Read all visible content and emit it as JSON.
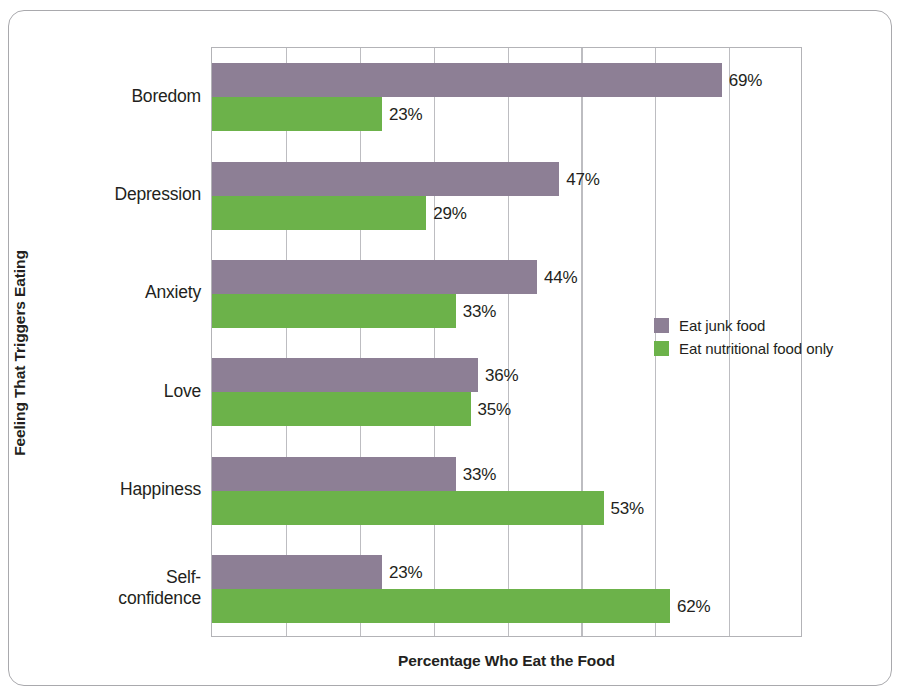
{
  "chart_data": {
    "type": "bar",
    "orientation": "horizontal",
    "title": "",
    "xlabel": "Percentage Who Eat the Food",
    "ylabel": "Feeling That Triggers Eating",
    "categories": [
      "Boredom",
      "Depression",
      "Anxiety",
      "Love",
      "Happiness",
      "Self-confidence"
    ],
    "category_display_lines": [
      [
        "Boredom"
      ],
      [
        "Depression"
      ],
      [
        "Anxiety"
      ],
      [
        "Love"
      ],
      [
        "Happiness"
      ],
      [
        "Self-",
        "confidence"
      ]
    ],
    "series": [
      {
        "name": "Eat junk food",
        "color": "#8d7f95",
        "values": [
          69,
          47,
          44,
          36,
          33,
          23
        ],
        "value_labels": [
          "69%",
          "47%",
          "44%",
          "36%",
          "33%",
          "23%"
        ]
      },
      {
        "name": "Eat nutritional food only",
        "color": "#6cb24a",
        "values": [
          23,
          29,
          33,
          35,
          53,
          62
        ],
        "value_labels": [
          "23%",
          "29%",
          "33%",
          "35%",
          "53%",
          "62%"
        ]
      }
    ],
    "xlim": [
      0,
      80
    ],
    "xticks": [
      0,
      10,
      20,
      30,
      40,
      50,
      60,
      70,
      80
    ],
    "xtick_labels": [
      "",
      "",
      "",
      "",
      "",
      "",
      "",
      "",
      ""
    ],
    "grid": "vertical",
    "legend_position": "middle-right",
    "frame": true
  },
  "colors": {
    "junk_food": "#8d7f95",
    "nutritional_food": "#6cb24a",
    "gridline": "#bdbdc1",
    "plot_border": "#b3b3b7",
    "frame_border": "#a9a9ad",
    "text": "#231f20",
    "background": "#ffffff"
  },
  "axes": {
    "y_title": "Feeling That Triggers Eating",
    "x_title": "Percentage Who Eat the Food"
  },
  "legend": {
    "items": [
      {
        "label": "Eat junk food",
        "color": "#8d7f95",
        "swatch": "legend-swatch-junk-food"
      },
      {
        "label": "Eat nutritional food only",
        "color": "#6cb24a",
        "swatch": "legend-swatch-nutritional-food"
      }
    ]
  }
}
